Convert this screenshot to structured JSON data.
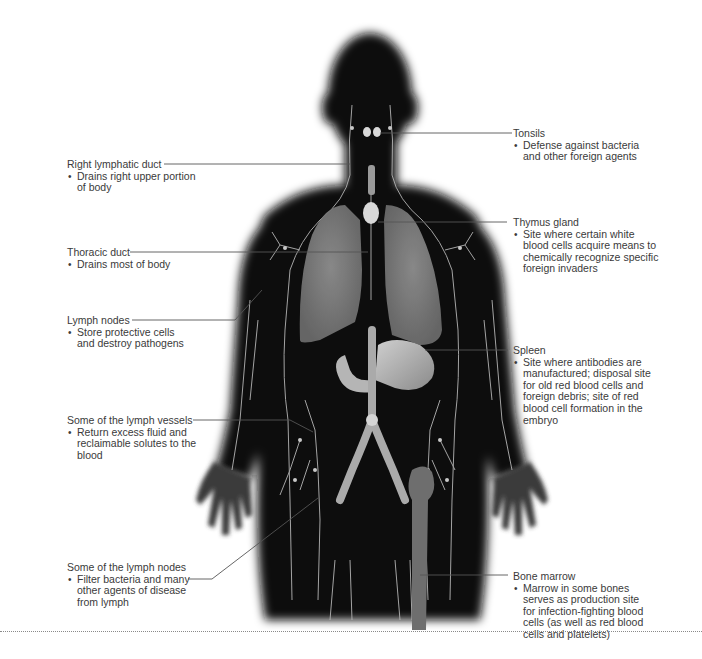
{
  "diagram": {
    "colors": {
      "body_silhouette": "#0d0d0d",
      "lymph_vessels": "#b8b8b8",
      "organs": "#8a8a8a",
      "background": "#ffffff",
      "leader_lines": "#555555"
    },
    "labels_left": [
      {
        "id": "right-lymphatic-duct",
        "title": "Right lymphatic duct",
        "desc": "Drains right upper portion of body"
      },
      {
        "id": "thoracic-duct",
        "title": "Thoracic duct",
        "desc": "Drains most of body"
      },
      {
        "id": "lymph-nodes",
        "title": "Lymph nodes",
        "desc": "Store protective cells and destroy pathogens"
      },
      {
        "id": "lymph-vessels",
        "title": "Some of the lymph vessels",
        "desc": "Return excess fluid and reclaimable solutes to the blood"
      },
      {
        "id": "some-lymph-nodes",
        "title": "Some of the lymph nodes",
        "desc": "Filter bacteria and many other agents of disease from lymph"
      }
    ],
    "labels_right": [
      {
        "id": "tonsils",
        "title": "Tonsils",
        "desc": "Defense against bacteria and other foreign agents"
      },
      {
        "id": "thymus-gland",
        "title": "Thymus gland",
        "desc": "Site where certain white blood cells acquire means to chemically recognize specific foreign invaders"
      },
      {
        "id": "spleen",
        "title": "Spleen",
        "desc": "Site where antibodies are manufactured; disposal site for old red blood cells and foreign debris; site of red blood cell formation in the embryo"
      },
      {
        "id": "bone-marrow",
        "title": "Bone marrow",
        "desc": "Marrow in some bones serves as production site for infection-fighting blood cells (as well as red blood cells and platelets)"
      }
    ]
  }
}
